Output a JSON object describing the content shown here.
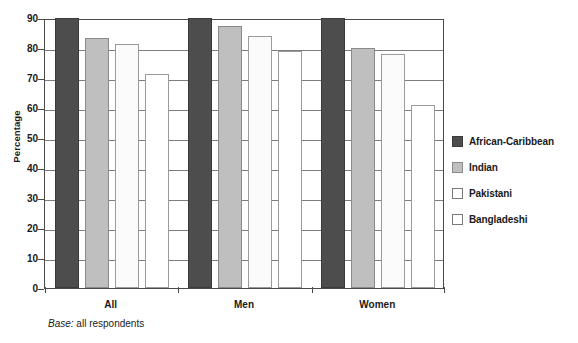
{
  "chart_data": {
    "type": "bar",
    "title": "",
    "subtitle": "",
    "xlabel": "",
    "ylabel": "Percentage",
    "ylim": [
      0,
      90
    ],
    "ytick_step": 10,
    "yticks": [
      0,
      10,
      20,
      30,
      40,
      50,
      60,
      70,
      80,
      90
    ],
    "ytick_labels": [
      "0",
      "10",
      "20",
      "30",
      "40",
      "50",
      "60",
      "70",
      "80",
      "90"
    ],
    "categories": [
      "All",
      "Men",
      "Women"
    ],
    "grid": "horizontal",
    "legend_position": "right",
    "series": [
      {
        "name": "African-Caribbean",
        "color": "#4d4d4d",
        "values": [
          90,
          90,
          90
        ]
      },
      {
        "name": "Indian",
        "color": "#bfbfbf",
        "values": [
          83.5,
          87.5,
          80
        ]
      },
      {
        "name": "Pakistani",
        "color": "#fbfbfb",
        "values": [
          81.5,
          84,
          78
        ]
      },
      {
        "name": "Bangladeshi",
        "color": "#ffffff",
        "values": [
          71.5,
          79,
          61
        ]
      }
    ],
    "annotations": [
      {
        "name": "base-note",
        "base_word": "Base:",
        "text": " all respondents"
      }
    ]
  },
  "notes": {
    "base_word": "Base:",
    "base_text": " all respondents"
  }
}
